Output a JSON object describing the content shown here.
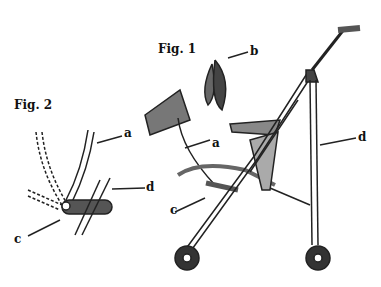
{
  "figures": [
    {
      "title": "Fig. 1",
      "labels": [
        "a",
        "b",
        "c",
        "d"
      ]
    },
    {
      "title": "Fig. 2",
      "labels": [
        "a",
        "c",
        "d"
      ]
    }
  ],
  "fig1": {
    "title": "Fig. 1",
    "a": "a",
    "b": "b",
    "c": "c",
    "d": "d"
  },
  "fig2": {
    "title": "Fig. 2",
    "a": "a",
    "c": "c",
    "d": "d"
  }
}
